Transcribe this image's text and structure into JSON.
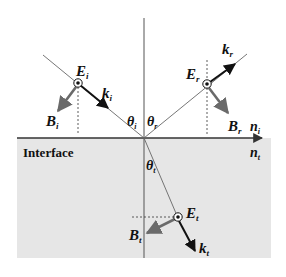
{
  "diagram": {
    "colors": {
      "background": "#ffffff",
      "lower_medium": "#e6e6e6",
      "line": "#444444",
      "ray": "#555555",
      "k_vector": "#111111",
      "b_vector": "#6a6a6a"
    },
    "interface_label": "Interface",
    "media": {
      "upper": {
        "symbol": "n",
        "sub": "i"
      },
      "lower": {
        "symbol": "n",
        "sub": "t"
      }
    },
    "angles": {
      "incident": {
        "symbol": "θ",
        "sub": "i"
      },
      "reflected": {
        "symbol": "θ",
        "sub": "r"
      },
      "transmitted": {
        "symbol": "θ",
        "sub": "t"
      }
    },
    "waves": {
      "incident": {
        "E": {
          "symbol": "E",
          "sub": "i"
        },
        "k": {
          "symbol": "k",
          "sub": "i"
        },
        "B": {
          "symbol": "B",
          "sub": "i"
        }
      },
      "reflected": {
        "E": {
          "symbol": "E",
          "sub": "r"
        },
        "k": {
          "symbol": "k",
          "sub": "r"
        },
        "B": {
          "symbol": "B",
          "sub": "r"
        }
      },
      "transmitted": {
        "E": {
          "symbol": "E",
          "sub": "t"
        },
        "k": {
          "symbol": "k",
          "sub": "t"
        },
        "B": {
          "symbol": "B",
          "sub": "t"
        }
      }
    }
  }
}
